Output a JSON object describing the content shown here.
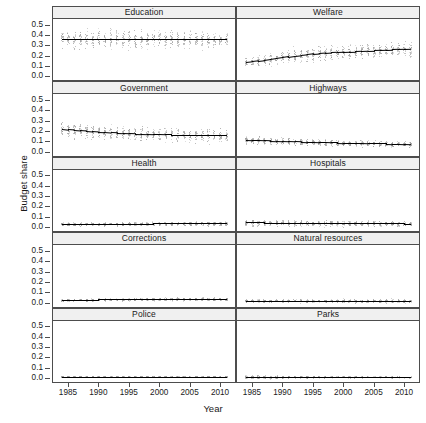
{
  "chart_data": {
    "type": "scatter",
    "title": "",
    "xlabel": "Year",
    "ylabel": "Budget share",
    "xlim": [
      1983.2,
      2011.8
    ],
    "ylim": [
      -0.03,
      0.555
    ],
    "xticks": [
      1985,
      1990,
      1995,
      2000,
      2005,
      2010
    ],
    "xtick_labels": [
      "1985",
      "1990",
      "1995",
      "2000",
      "2005",
      "2010"
    ],
    "yticks": [
      0.0,
      0.1,
      0.2,
      0.3,
      0.4,
      0.5
    ],
    "ytick_labels": [
      "0.0",
      "0.1",
      "0.2",
      "0.3",
      "0.4",
      "0.5"
    ],
    "grid": false,
    "legend": "none",
    "layout": {
      "rows": 5,
      "cols": 2,
      "strip_position": "top"
    },
    "colors": {
      "points": "#9a9a9a",
      "trend_line": "#000000",
      "strip_background": "#f0f0f0",
      "panel_border": "#4d4d4d",
      "background": "#ffffff"
    },
    "x": [
      1984,
      1985,
      1986,
      1987,
      1988,
      1989,
      1990,
      1991,
      1992,
      1993,
      1994,
      1995,
      1996,
      1997,
      1998,
      1999,
      2000,
      2001,
      2002,
      2003,
      2004,
      2005,
      2006,
      2007,
      2008,
      2009,
      2010,
      2011
    ],
    "panels": [
      {
        "name": "Education",
        "row": 1,
        "col": 1,
        "trend": [
          0.362,
          0.362,
          0.362,
          0.363,
          0.363,
          0.363,
          0.363,
          0.363,
          0.362,
          0.362,
          0.362,
          0.362,
          0.362,
          0.362,
          0.362,
          0.362,
          0.362,
          0.362,
          0.361,
          0.361,
          0.361,
          0.361,
          0.361,
          0.361,
          0.361,
          0.36,
          0.36,
          0.36
        ],
        "spread": [
          0.085,
          0.085,
          0.086,
          0.086,
          0.087,
          0.087,
          0.087,
          0.087,
          0.086,
          0.086,
          0.086,
          0.086,
          0.085,
          0.085,
          0.085,
          0.085,
          0.084,
          0.084,
          0.084,
          0.083,
          0.083,
          0.083,
          0.082,
          0.082,
          0.082,
          0.081,
          0.081,
          0.08
        ]
      },
      {
        "name": "Welfare",
        "row": 1,
        "col": 2,
        "trend": [
          0.139,
          0.145,
          0.152,
          0.159,
          0.167,
          0.175,
          0.183,
          0.191,
          0.199,
          0.206,
          0.212,
          0.218,
          0.223,
          0.227,
          0.231,
          0.234,
          0.237,
          0.24,
          0.243,
          0.246,
          0.248,
          0.251,
          0.254,
          0.257,
          0.26,
          0.263,
          0.266,
          0.269
        ],
        "spread": [
          0.046,
          0.047,
          0.049,
          0.051,
          0.053,
          0.055,
          0.057,
          0.059,
          0.061,
          0.063,
          0.064,
          0.065,
          0.066,
          0.067,
          0.068,
          0.068,
          0.069,
          0.069,
          0.07,
          0.07,
          0.071,
          0.071,
          0.072,
          0.072,
          0.072,
          0.073,
          0.073,
          0.073
        ]
      },
      {
        "name": "Government",
        "row": 2,
        "col": 1,
        "trend": [
          0.222,
          0.216,
          0.211,
          0.206,
          0.201,
          0.197,
          0.193,
          0.19,
          0.186,
          0.183,
          0.181,
          0.178,
          0.176,
          0.174,
          0.172,
          0.17,
          0.169,
          0.167,
          0.166,
          0.165,
          0.164,
          0.163,
          0.162,
          0.161,
          0.16,
          0.159,
          0.158,
          0.157
        ],
        "spread": [
          0.072,
          0.072,
          0.071,
          0.071,
          0.07,
          0.07,
          0.069,
          0.069,
          0.068,
          0.068,
          0.067,
          0.067,
          0.067,
          0.066,
          0.066,
          0.066,
          0.065,
          0.065,
          0.065,
          0.064,
          0.064,
          0.064,
          0.063,
          0.063,
          0.063,
          0.062,
          0.062,
          0.062
        ]
      },
      {
        "name": "Highways",
        "row": 2,
        "col": 2,
        "trend": [
          0.115,
          0.113,
          0.112,
          0.11,
          0.108,
          0.106,
          0.104,
          0.102,
          0.1,
          0.098,
          0.096,
          0.095,
          0.093,
          0.092,
          0.09,
          0.089,
          0.087,
          0.086,
          0.085,
          0.084,
          0.082,
          0.081,
          0.08,
          0.079,
          0.077,
          0.076,
          0.074,
          0.072
        ],
        "spread": [
          0.036,
          0.036,
          0.035,
          0.035,
          0.034,
          0.034,
          0.033,
          0.033,
          0.032,
          0.032,
          0.032,
          0.031,
          0.031,
          0.03,
          0.03,
          0.03,
          0.029,
          0.029,
          0.029,
          0.028,
          0.028,
          0.028,
          0.028,
          0.027,
          0.027,
          0.027,
          0.026,
          0.026
        ]
      },
      {
        "name": "Health",
        "row": 3,
        "col": 1,
        "trend": [
          0.031,
          0.031,
          0.031,
          0.032,
          0.032,
          0.032,
          0.032,
          0.033,
          0.033,
          0.033,
          0.033,
          0.034,
          0.034,
          0.034,
          0.034,
          0.035,
          0.035,
          0.035,
          0.035,
          0.036,
          0.036,
          0.036,
          0.036,
          0.037,
          0.037,
          0.037,
          0.037,
          0.038
        ],
        "spread": [
          0.016,
          0.016,
          0.016,
          0.016,
          0.016,
          0.016,
          0.016,
          0.017,
          0.017,
          0.017,
          0.017,
          0.017,
          0.017,
          0.017,
          0.017,
          0.018,
          0.018,
          0.018,
          0.018,
          0.018,
          0.018,
          0.018,
          0.018,
          0.018,
          0.019,
          0.019,
          0.019,
          0.019
        ]
      },
      {
        "name": "Hospitals",
        "row": 3,
        "col": 2,
        "trend": [
          0.046,
          0.045,
          0.045,
          0.044,
          0.044,
          0.043,
          0.043,
          0.042,
          0.042,
          0.041,
          0.041,
          0.04,
          0.04,
          0.039,
          0.039,
          0.038,
          0.038,
          0.038,
          0.037,
          0.037,
          0.036,
          0.036,
          0.036,
          0.035,
          0.035,
          0.035,
          0.034,
          0.034
        ],
        "spread": [
          0.029,
          0.029,
          0.029,
          0.029,
          0.028,
          0.028,
          0.028,
          0.028,
          0.028,
          0.027,
          0.027,
          0.027,
          0.027,
          0.027,
          0.026,
          0.026,
          0.026,
          0.026,
          0.026,
          0.026,
          0.025,
          0.025,
          0.025,
          0.025,
          0.025,
          0.025,
          0.024,
          0.024
        ]
      },
      {
        "name": "Corrections",
        "row": 4,
        "col": 1,
        "trend": [
          0.024,
          0.025,
          0.025,
          0.026,
          0.027,
          0.028,
          0.029,
          0.029,
          0.03,
          0.031,
          0.031,
          0.032,
          0.032,
          0.033,
          0.033,
          0.033,
          0.034,
          0.034,
          0.034,
          0.034,
          0.034,
          0.035,
          0.035,
          0.035,
          0.035,
          0.035,
          0.035,
          0.035
        ],
        "spread": [
          0.011,
          0.011,
          0.011,
          0.012,
          0.012,
          0.012,
          0.013,
          0.013,
          0.013,
          0.013,
          0.014,
          0.014,
          0.014,
          0.014,
          0.014,
          0.014,
          0.014,
          0.015,
          0.015,
          0.015,
          0.015,
          0.015,
          0.015,
          0.015,
          0.015,
          0.015,
          0.015,
          0.015
        ]
      },
      {
        "name": "Natural resources",
        "row": 4,
        "col": 2,
        "trend": [
          0.019,
          0.019,
          0.019,
          0.019,
          0.019,
          0.019,
          0.019,
          0.019,
          0.019,
          0.019,
          0.019,
          0.019,
          0.018,
          0.018,
          0.018,
          0.018,
          0.018,
          0.018,
          0.018,
          0.018,
          0.017,
          0.017,
          0.017,
          0.017,
          0.017,
          0.017,
          0.016,
          0.016
        ],
        "spread": [
          0.014,
          0.014,
          0.014,
          0.014,
          0.015,
          0.015,
          0.015,
          0.015,
          0.015,
          0.015,
          0.016,
          0.016,
          0.016,
          0.016,
          0.016,
          0.016,
          0.016,
          0.016,
          0.017,
          0.017,
          0.017,
          0.017,
          0.017,
          0.017,
          0.018,
          0.018,
          0.018,
          0.018
        ]
      },
      {
        "name": "Police",
        "row": 5,
        "col": 1,
        "trend": [
          0.013,
          0.013,
          0.013,
          0.013,
          0.013,
          0.013,
          0.013,
          0.013,
          0.013,
          0.013,
          0.013,
          0.013,
          0.013,
          0.013,
          0.013,
          0.013,
          0.013,
          0.013,
          0.013,
          0.013,
          0.013,
          0.013,
          0.013,
          0.013,
          0.013,
          0.013,
          0.013,
          0.013
        ],
        "spread": [
          0.006,
          0.006,
          0.006,
          0.006,
          0.006,
          0.006,
          0.006,
          0.006,
          0.006,
          0.006,
          0.006,
          0.006,
          0.006,
          0.006,
          0.006,
          0.006,
          0.006,
          0.006,
          0.006,
          0.006,
          0.006,
          0.006,
          0.006,
          0.006,
          0.006,
          0.006,
          0.006,
          0.006
        ]
      },
      {
        "name": "Parks",
        "row": 5,
        "col": 2,
        "trend": [
          0.011,
          0.011,
          0.011,
          0.01,
          0.01,
          0.01,
          0.01,
          0.01,
          0.01,
          0.01,
          0.01,
          0.01,
          0.01,
          0.01,
          0.01,
          0.01,
          0.01,
          0.01,
          0.01,
          0.01,
          0.01,
          0.01,
          0.01,
          0.01,
          0.009,
          0.009,
          0.009,
          0.009
        ],
        "spread": [
          0.022,
          0.021,
          0.02,
          0.018,
          0.016,
          0.014,
          0.013,
          0.012,
          0.011,
          0.011,
          0.01,
          0.01,
          0.01,
          0.009,
          0.009,
          0.009,
          0.009,
          0.009,
          0.008,
          0.008,
          0.008,
          0.008,
          0.008,
          0.008,
          0.008,
          0.008,
          0.008,
          0.008
        ]
      }
    ]
  }
}
